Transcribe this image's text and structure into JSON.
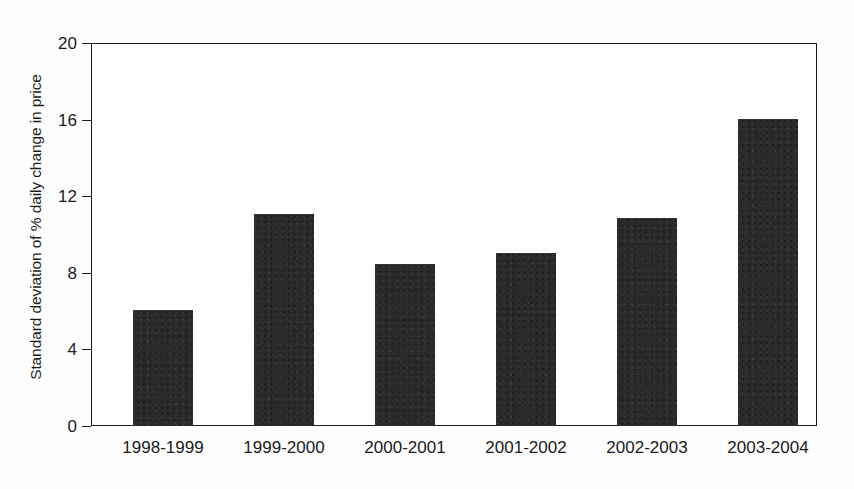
{
  "chart_data": {
    "type": "bar",
    "title": "",
    "subtitle": "",
    "xlabel": "",
    "ylabel": "Standard deviation of % daily change in price",
    "categories": [
      "1998-1999",
      "1999-2000",
      "2000-2001",
      "2001-2002",
      "2002-2003",
      "2003-2004"
    ],
    "values": [
      6.0,
      11.0,
      8.4,
      9.0,
      10.8,
      16.0
    ],
    "ylim": [
      0,
      20
    ],
    "xlim_categories": 6,
    "yticks": [
      0,
      4,
      8,
      12,
      16,
      20
    ],
    "ytick_labels": [
      "0",
      "4",
      "8",
      "12",
      "16",
      "20"
    ],
    "grid": false,
    "legend": null,
    "legend_position": "none",
    "annotations": [],
    "colors": {
      "bar_fill": "#2a2a2a",
      "axis_line": "#1d1d1a",
      "text": "#1a1a1a",
      "background": "#ffffff"
    }
  },
  "figure": {
    "background_color": "#fefefe",
    "axis": {
      "y_title": "Standard deviation of % daily change in price",
      "y_ticks": [
        {
          "label": "20",
          "value": 20
        },
        {
          "label": "16",
          "value": 16
        },
        {
          "label": "12",
          "value": 12
        },
        {
          "label": "8",
          "value": 8
        },
        {
          "label": "4",
          "value": 4
        },
        {
          "label": "0",
          "value": 0
        }
      ]
    },
    "bars": [
      {
        "category": "1998-1999",
        "value": 6.0
      },
      {
        "category": "1999-2000",
        "value": 11.0
      },
      {
        "category": "2000-2001",
        "value": 8.4
      },
      {
        "category": "2001-2002",
        "value": 9.0
      },
      {
        "category": "2002-2003",
        "value": 10.8
      },
      {
        "category": "2003-2004",
        "value": 16.0
      }
    ]
  }
}
